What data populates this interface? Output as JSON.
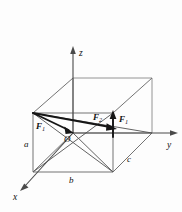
{
  "figure": {
    "background_color": "#fdfdfd",
    "line_color": "#6b6b6b",
    "axis_color": "#4a4a4a",
    "vector_color": "#161616"
  },
  "axes": [
    {
      "id": "z",
      "label": "z",
      "label_x": 79,
      "label_y": 55,
      "direction": "up"
    },
    {
      "id": "y",
      "label": "y",
      "label_x": 168,
      "label_y": 147,
      "direction": "right"
    },
    {
      "id": "x",
      "label": "x",
      "label_x": 14,
      "label_y": 199,
      "direction": "down-left"
    }
  ],
  "origin": {
    "label": "O",
    "label_x": 66,
    "label_y": 141,
    "point_x": 73,
    "point_y": 133
  },
  "dimensions": [
    {
      "id": "a",
      "label": "a",
      "label_x": 26,
      "label_y": 146,
      "edge": "vertical-left"
    },
    {
      "id": "b",
      "label": "b",
      "label_x": 70,
      "label_y": 182,
      "edge": "bottom-front"
    },
    {
      "id": "c",
      "label": "c",
      "label_x": 129,
      "label_y": 161,
      "edge": "bottom-right"
    }
  ],
  "vectors": [
    {
      "id": "F1-diagonal",
      "label": "F",
      "subscript": "1",
      "label_x": 38,
      "label_y": 127,
      "from_x": 33,
      "from_y": 113,
      "to_x": 71,
      "to_y": 132,
      "description": "force from top-left-front corner toward origin"
    },
    {
      "id": "F2-diagonal",
      "label": "F",
      "subscript": "2",
      "label_x": 96,
      "label_y": 119,
      "from_x": 33,
      "from_y": 113,
      "to_x": 116,
      "to_y": 128,
      "description": "long force vector to the right"
    },
    {
      "id": "F1-vertical",
      "label": "F",
      "subscript": "1",
      "label_x": 121,
      "label_y": 121,
      "from_x": 113,
      "from_y": 136,
      "to_x": 113,
      "to_y": 112,
      "description": "vertical upward force vector"
    }
  ],
  "box": {
    "vertices": {
      "front_top_left": [
        33,
        113
      ],
      "front_top_right": [
        113,
        113
      ],
      "front_bottom_left": [
        33,
        172
      ],
      "front_bottom_right": [
        113,
        172
      ],
      "back_top_left": [
        73,
        78
      ],
      "back_top_right": [
        152,
        78
      ],
      "back_bottom_left": [
        73,
        133
      ],
      "back_bottom_right": [
        152,
        133
      ]
    }
  }
}
